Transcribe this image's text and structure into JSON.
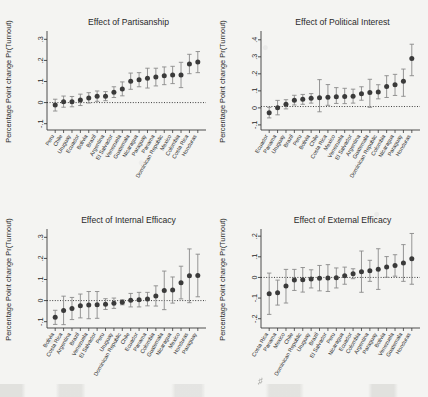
{
  "figure": {
    "background": "#f4f4f2",
    "ylabel": "Percentage Point change Pr(Turnout)",
    "marker_color": "#3a3a3a",
    "error_bar_color": "#8a8a8a",
    "zero_line_style": "dotted"
  },
  "chart_data": [
    {
      "type": "scatter",
      "title": "Effect of Partisanship",
      "xlabel": "",
      "ylabel": "Percentage Point change Pr(Turnout)",
      "ylim": [
        -0.13,
        0.33
      ],
      "yticks": [
        "-.1",
        "0",
        ".1",
        ".2",
        ".3"
      ],
      "ytick_values": [
        -0.1,
        0,
        0.1,
        0.2,
        0.3
      ],
      "grid": false,
      "legend": "none",
      "zero_reference_line": 0,
      "categories": [
        "Peru",
        "Chile",
        "Uruguay",
        "Ecuador",
        "Bolivia",
        "Brazil",
        "Argentina",
        "El Salvador",
        "Venezuela",
        "Guatemala",
        "Nicaragua",
        "Paraguay",
        "Panama",
        "Dominican Republic",
        "Mexico",
        "Colombia",
        "Costa Rica",
        "Honduras"
      ],
      "values": [
        -0.012,
        0.004,
        0.004,
        0.012,
        0.022,
        0.03,
        0.03,
        0.049,
        0.065,
        0.101,
        0.108,
        0.116,
        0.121,
        0.127,
        0.131,
        0.131,
        0.183,
        0.192
      ],
      "ci_lower": [
        -0.04,
        -0.022,
        -0.02,
        -0.014,
        -0.002,
        0.006,
        0.009,
        0.024,
        0.032,
        0.063,
        0.075,
        0.069,
        0.079,
        0.085,
        0.09,
        0.071,
        0.137,
        0.142
      ],
      "ci_upper": [
        0.016,
        0.031,
        0.029,
        0.04,
        0.047,
        0.055,
        0.052,
        0.075,
        0.098,
        0.14,
        0.142,
        0.163,
        0.163,
        0.169,
        0.172,
        0.191,
        0.229,
        0.242
      ]
    },
    {
      "type": "scatter",
      "title": "Effect of Political Interest",
      "xlabel": "",
      "ylabel": "Percentage Point change Pr(Turnout)",
      "ylim": [
        -0.13,
        0.44
      ],
      "yticks": [
        "-.1",
        "0",
        ".1",
        ".2",
        ".3",
        ".4"
      ],
      "ytick_values": [
        -0.1,
        0,
        0.1,
        0.2,
        0.3,
        0.4
      ],
      "grid": false,
      "legend": "none",
      "zero_reference_line": 0.008,
      "categories": [
        "Ecuador",
        "Panama",
        "Uruguay",
        "Brazil",
        "Peru",
        "Bolivia",
        "Chile",
        "Costa Rica",
        "Mexico",
        "Venezuela",
        "El Salvador",
        "Argentina",
        "Guatemala",
        "Dominican Republic",
        "Colombia",
        "Nicaragua",
        "Paraguay",
        "Honduras"
      ],
      "values": [
        -0.028,
        0.001,
        0.021,
        0.045,
        0.05,
        0.056,
        0.06,
        0.063,
        0.065,
        0.067,
        0.068,
        0.083,
        0.09,
        0.093,
        0.126,
        0.136,
        0.157,
        0.29
      ],
      "ci_lower": [
        -0.059,
        -0.041,
        -0.006,
        0.017,
        0.021,
        0.028,
        -0.023,
        0.015,
        0.026,
        0.025,
        0.028,
        0.045,
        0.003,
        0.053,
        0.061,
        0.073,
        0.068,
        0.189
      ],
      "ci_upper": [
        0.003,
        0.044,
        0.048,
        0.074,
        0.079,
        0.084,
        0.166,
        0.137,
        0.119,
        0.115,
        0.11,
        0.124,
        0.168,
        0.136,
        0.189,
        0.197,
        0.228,
        0.374
      ]
    },
    {
      "type": "scatter",
      "title": "Effect of Internal Efficacy",
      "xlabel": "",
      "ylabel": "Percentage Point change Pr(Turnout)",
      "ylim": [
        -0.13,
        0.33
      ],
      "yticks": [
        "-.1",
        "0",
        ".1",
        ".2",
        ".3"
      ],
      "ytick_values": [
        -0.1,
        0,
        0.1,
        0.2,
        0.3
      ],
      "grid": false,
      "legend": "none",
      "zero_reference_line": 0,
      "categories": [
        "Bolivia",
        "Costa Rica",
        "Argentina",
        "Brazil",
        "Venezuela",
        "El Salvador",
        "Peru",
        "Uruguay",
        "Dominican Republic",
        "Chile",
        "Ecuador",
        "Panama",
        "Colombia",
        "Guatemala",
        "Nicaragua",
        "Mexico",
        "Honduras",
        "Paraguay"
      ],
      "values": [
        -0.079,
        -0.047,
        -0.038,
        -0.025,
        -0.021,
        -0.02,
        -0.017,
        -0.013,
        -0.008,
        0.002,
        0.004,
        0.007,
        0.022,
        0.048,
        0.05,
        0.085,
        0.118,
        0.119
      ],
      "ci_lower": [
        -0.113,
        -0.114,
        -0.09,
        -0.082,
        -0.086,
        -0.084,
        -0.042,
        -0.037,
        -0.02,
        -0.03,
        -0.03,
        -0.025,
        -0.026,
        -0.043,
        -0.012,
        0.008,
        -0.01,
        0.018
      ],
      "ci_upper": [
        -0.046,
        0.021,
        0.015,
        0.031,
        0.043,
        0.043,
        0.009,
        0.012,
        0.004,
        0.034,
        0.039,
        0.039,
        0.07,
        0.14,
        0.112,
        0.163,
        0.245,
        0.22
      ]
    },
    {
      "type": "scatter",
      "title": "Effect of External Efficacy",
      "xlabel": "",
      "ylabel": "Percentage Point change Pr(Turnout)",
      "ylim": [
        -0.245,
        0.225
      ],
      "yticks": [
        "-.2",
        "-.1",
        "0",
        ".1",
        ".2"
      ],
      "ytick_values": [
        -0.2,
        -0.1,
        0,
        0.1,
        0.2
      ],
      "grid": false,
      "legend": "none",
      "zero_reference_line": 0,
      "categories": [
        "Costa Rica",
        "Panama",
        "Mexico",
        "Chile",
        "Dominican Republic",
        "Uruguay",
        "Brazil",
        "El Salvador",
        "Peru",
        "Nicaragua",
        "Ecuador",
        "Colombia",
        "Argentina",
        "Paraguay",
        "Bolivia",
        "Venezuela",
        "Guatemala",
        "Honduras"
      ],
      "values": [
        -0.079,
        -0.074,
        -0.042,
        -0.012,
        -0.011,
        -0.007,
        -0.004,
        -0.003,
        -0.002,
        0.008,
        0.018,
        0.028,
        0.032,
        0.04,
        0.051,
        0.058,
        0.07,
        0.09
      ],
      "ci_lower": [
        -0.179,
        -0.134,
        -0.124,
        -0.063,
        -0.071,
        -0.051,
        -0.065,
        -0.068,
        -0.051,
        -0.033,
        -0.006,
        -0.072,
        -0.019,
        -0.058,
        0.001,
        0.006,
        -0.019,
        -0.033
      ],
      "ci_upper": [
        0.021,
        -0.013,
        0.039,
        0.039,
        0.048,
        0.037,
        0.058,
        0.062,
        0.046,
        0.05,
        0.042,
        0.128,
        0.083,
        0.139,
        0.101,
        0.11,
        0.159,
        0.213
      ]
    }
  ]
}
